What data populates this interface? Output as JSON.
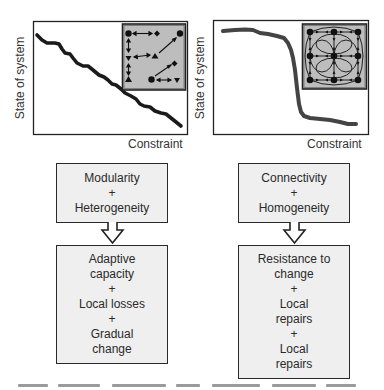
{
  "panels": [
    {
      "id": "left",
      "ylabel": "State of system",
      "xlabel": "Constraint",
      "curve": "gradual",
      "inset": "modular-heterogeneous-network",
      "box_top": {
        "lines": [
          "Modularity",
          "+",
          "Heterogeneity"
        ]
      },
      "box_bottom": {
        "lines": [
          "Adaptive",
          "capacity",
          "+",
          "Local losses",
          "+",
          "Gradual",
          "change"
        ]
      }
    },
    {
      "id": "right",
      "ylabel": "State of system",
      "xlabel": "Constraint",
      "curve": "abrupt",
      "inset": "connected-homogeneous-network",
      "box_top": {
        "lines": [
          "Connectivity",
          "+",
          "Homogeneity"
        ]
      },
      "box_bottom": {
        "lines": [
          "Resistance to",
          "change",
          "+",
          "Local",
          "repairs",
          "+",
          "Local",
          "repairs"
        ]
      }
    }
  ],
  "colors": {
    "line": "#1a1a1a",
    "inset_bg": "#bdbdbd",
    "box_bg": "#efefef",
    "frame": "#222222"
  },
  "icons": {
    "arrow": "hollow-down-arrow"
  }
}
